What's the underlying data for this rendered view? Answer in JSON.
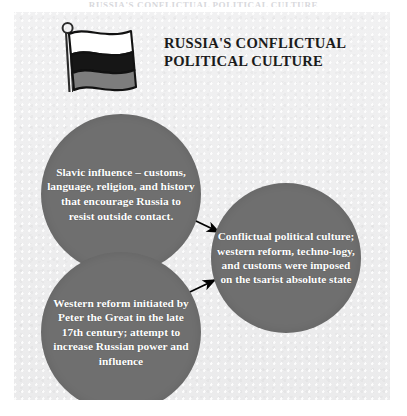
{
  "page": {
    "running_head": "RUSSIA'S CONFLICTUAL POLITICAL CULTURE",
    "background_color": "#efefef",
    "paper_color": "#eeeeef"
  },
  "header": {
    "flag_icon": "russian-flag-icon",
    "flag": {
      "description": "waving Russian tricolour flag in grayscale on a pole with round finial",
      "stripes": [
        {
          "name": "white",
          "color": "#ffffff"
        },
        {
          "name": "black",
          "color": "#1a1a1a"
        },
        {
          "name": "gray",
          "color": "#808080"
        }
      ],
      "pole_color": "#2b2b2b"
    },
    "title_lines": [
      "RUSSIA'S CONFLICTUAL",
      "POLITICAL CULTURE"
    ],
    "title_color": "#1b1b1b"
  },
  "diagram": {
    "type": "flow-diagram",
    "node_fill_color": "#6f6f6f",
    "node_text_color": "#ffffff",
    "arrow_color": "#000000",
    "nodes": [
      {
        "id": "slavic",
        "name": "slavic-influence-node",
        "text": "Slavic influence – customs, language, religion, and history that encourage Russia to resist outside contact.",
        "lines": [
          "Slavic influence –",
          "customs, language,",
          "religion, and history",
          "that encourage Russia",
          "to resist outside",
          "contact."
        ]
      },
      {
        "id": "western",
        "name": "western-reform-node",
        "text": "Western reform initiated by Peter the Great in the late 17th century; attempt to increase Russian power and influence",
        "lines": [
          "Western reform",
          "initiated by Peter",
          "the Great in the late",
          "17th century; attempt",
          "to increase Russian",
          "power and influence"
        ]
      },
      {
        "id": "conflictual",
        "name": "conflictual-culture-node",
        "text": "Conflictual political culture; western reform, techno-logy, and customs were imposed on the tsarist absolute state",
        "lines": [
          "Conflictual",
          "political culture;",
          "western reform, techno-",
          "logy, and customs were",
          "imposed on the tsarist",
          "absolute state"
        ]
      }
    ],
    "arrows": [
      {
        "id": "arrow-slavic-to-conflictual",
        "from": "slavic",
        "to": "conflictual",
        "direction": "down-right"
      },
      {
        "id": "arrow-western-to-conflictual",
        "from": "western",
        "to": "conflictual",
        "direction": "up-right"
      }
    ]
  }
}
